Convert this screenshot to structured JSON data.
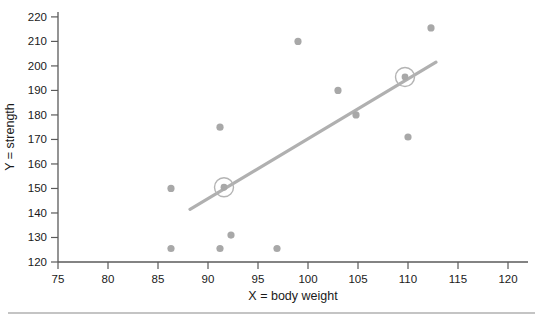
{
  "chart_data": {
    "type": "scatter",
    "title": "",
    "xlabel": "X = body weight",
    "ylabel": "Y = strength",
    "xlim": [
      75,
      122
    ],
    "ylim": [
      120,
      222
    ],
    "xticks": [
      75,
      80,
      85,
      90,
      95,
      100,
      105,
      110,
      115,
      120
    ],
    "yticks": [
      120,
      130,
      140,
      150,
      160,
      170,
      180,
      190,
      200,
      210,
      220
    ],
    "xtick_labels": [
      "75",
      "80",
      "85",
      "90",
      "95",
      "100",
      "105",
      "110",
      "115",
      "120"
    ],
    "ytick_labels": [
      "120",
      "130",
      "140",
      "150",
      "160",
      "170",
      "180",
      "190",
      "200",
      "210",
      "220"
    ],
    "grid": false,
    "legend": false,
    "point_color": "#a8a8a8",
    "line_color": "#b0b0b0",
    "points": [
      {
        "x": 86.3,
        "y": 150,
        "highlighted": false
      },
      {
        "x": 86.3,
        "y": 125.5,
        "highlighted": false
      },
      {
        "x": 91.2,
        "y": 175,
        "highlighted": false
      },
      {
        "x": 91.2,
        "y": 125.5,
        "highlighted": false
      },
      {
        "x": 91.6,
        "y": 150.5,
        "highlighted": true
      },
      {
        "x": 92.3,
        "y": 131,
        "highlighted": false
      },
      {
        "x": 96.9,
        "y": 125.5,
        "highlighted": false
      },
      {
        "x": 99.0,
        "y": 210,
        "highlighted": false
      },
      {
        "x": 103.0,
        "y": 190,
        "highlighted": false
      },
      {
        "x": 104.8,
        "y": 180,
        "highlighted": false
      },
      {
        "x": 109.7,
        "y": 195.5,
        "highlighted": true
      },
      {
        "x": 110.0,
        "y": 171,
        "highlighted": false
      },
      {
        "x": 112.3,
        "y": 215.5,
        "highlighted": false
      }
    ],
    "regression_line": {
      "x_start": 88.2,
      "y_start": 141.5,
      "x_end": 112.8,
      "y_end": 201.5
    },
    "annotations": []
  },
  "footer": {
    "rule_visible": true,
    "caption": ""
  }
}
